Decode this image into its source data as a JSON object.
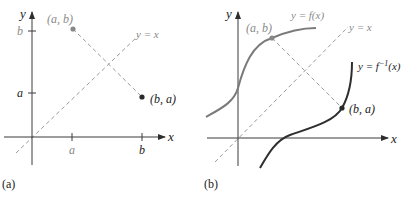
{
  "panel_a": {
    "caption": "(a)",
    "axis_x_label": "x",
    "axis_y_label": "y",
    "tick_x": [
      "a",
      "b"
    ],
    "tick_y": [
      "b",
      "a"
    ],
    "point_ab_label": "(a, b)",
    "point_ba_label": "(b, a)",
    "line_label": "y = x"
  },
  "panel_b": {
    "caption": "(b)",
    "axis_x_label": "x",
    "axis_y_label": "y",
    "point_ab_label": "(a, b)",
    "point_ba_label": "(b, a)",
    "line_label": "y = x",
    "f_label": "y = f(x)",
    "finv_label_prefix": "y = f",
    "finv_label_sup": "−1",
    "finv_label_suffix": "(x)"
  },
  "colors": {
    "axis": "#3a3a3a",
    "gray_label": "#8a8a8a",
    "dashed": "#9a9a9a",
    "point_ab": "#888888",
    "point_ba": "#2a2a2a",
    "f_curve": "#7a7a7a",
    "finv_curve": "#2e2e2e",
    "text": "#222222"
  }
}
